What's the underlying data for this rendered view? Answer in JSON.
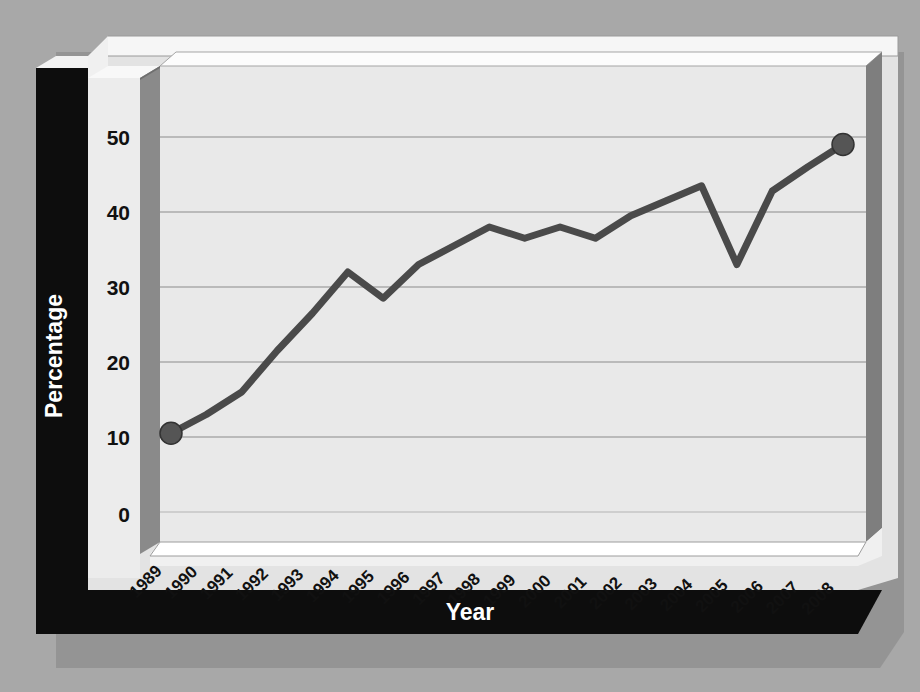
{
  "chart_data": {
    "type": "line",
    "title": "",
    "xlabel": "Year",
    "ylabel": "Percentage",
    "categories": [
      "1989",
      "1990",
      "1991",
      "1992",
      "1993",
      "1994",
      "1995",
      "1996",
      "1997",
      "1998",
      "1999",
      "2000",
      "2001",
      "2002",
      "2003",
      "2004",
      "2005",
      "2006",
      "2007",
      "2008"
    ],
    "values": [
      10.5,
      13,
      16,
      21.5,
      26.5,
      32,
      28.5,
      33,
      35.5,
      38,
      36.5,
      38,
      36.5,
      39.5,
      41.5,
      43.5,
      33,
      42.8,
      46,
      49
    ],
    "series": [
      {
        "name": "Percentage",
        "values": [
          10.5,
          13,
          16,
          21.5,
          26.5,
          32,
          28.5,
          33,
          35.5,
          38,
          36.5,
          38,
          36.5,
          39.5,
          41.5,
          43.5,
          33,
          42.8,
          46,
          49
        ]
      }
    ],
    "ytick_labels": [
      "0",
      "10",
      "20",
      "30",
      "40",
      "50"
    ],
    "ytick_values": [
      0,
      10,
      20,
      30,
      40,
      50
    ],
    "ylim": [
      0,
      55
    ],
    "grid": true,
    "grid_axis": "y",
    "legend": false,
    "legend_position": "none",
    "markers": {
      "first_point": {
        "category": "1989",
        "value": 10.5
      },
      "last_point": {
        "category": "2008",
        "value": 49
      }
    },
    "style": {
      "three_d": true,
      "line_color": "#4a4a4a",
      "line_width": 7,
      "marker_color": "#555555",
      "plot_background": "#e9e9e9",
      "panel_background": "#e3e3e3",
      "axis_band_color": "#0d0d0d",
      "wall_color": "#808080",
      "page_background": "#a8a8a8"
    }
  },
  "axis_titles": {
    "x": "Year",
    "y": "Percentage"
  }
}
